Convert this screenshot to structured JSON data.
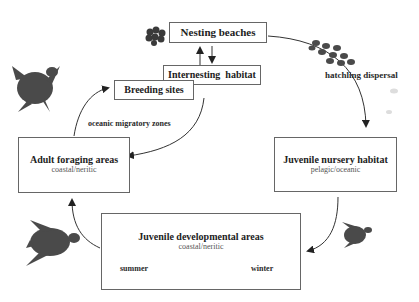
{
  "nodes": {
    "nesting": {
      "title": "Nesting beaches"
    },
    "internesting": {
      "title": "Internesting  habitat"
    },
    "breeding": {
      "title": "Breeding sites"
    },
    "adult": {
      "title": "Adult foraging areas",
      "sub": "coastal/neritic"
    },
    "nursery": {
      "title": "Juvenile nursery habitat",
      "sub": "pelagic/oceanic"
    },
    "developmental": {
      "title": "Juvenile developmental areas",
      "sub": "coastal/neritic"
    }
  },
  "labels": {
    "hatchling": "hatchling dispersal",
    "oceanic": "oceanic migratory zones",
    "summer": "summer",
    "winter": "winter"
  },
  "colors": {
    "turtle": "#4a4a4a",
    "line": "#333333"
  }
}
